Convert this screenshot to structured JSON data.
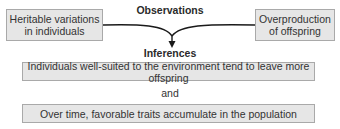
{
  "diagram": {
    "observations": {
      "heading": "Observations",
      "items": [
        {
          "line1": "Heritable variations",
          "line2": "in individuals"
        },
        {
          "line1": "Overproduction",
          "line2": "of offspring"
        }
      ]
    },
    "inferences": {
      "heading": "Inferences",
      "items": [
        {
          "text": "Individuals well-suited to the environment tend to leave more offspring"
        },
        {
          "text": "Over time, favorable traits accumulate in the population"
        }
      ],
      "connector": "and"
    },
    "colors": {
      "box_fill": "#e6e6e6",
      "box_border": "#a9a9a9",
      "arrow": "#1a1a1a",
      "text": "#333333"
    }
  }
}
